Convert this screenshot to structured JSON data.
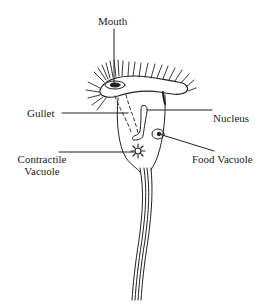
{
  "diagram": {
    "colors": {
      "ink": "#222222",
      "background": "#ffffff"
    },
    "labels": {
      "mouth": "Mouth",
      "gullet": "Gullet",
      "nucleus": "Nucleus",
      "contractile_vacuole_line1": "Contractile",
      "contractile_vacuole_line2": "Vacuole",
      "food_vacuole": "Food Vacuole"
    }
  }
}
